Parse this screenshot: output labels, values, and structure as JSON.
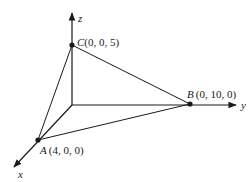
{
  "diagram": {
    "type": "3d-coordinate-triangle",
    "axes": {
      "x": {
        "label": "x"
      },
      "y": {
        "label": "y"
      },
      "z": {
        "label": "z"
      }
    },
    "points": [
      {
        "name": "A",
        "coords": "(4, 0, 0)"
      },
      {
        "name": "B",
        "coords": "(0, 10, 0)"
      },
      {
        "name": "C",
        "coords": "(0, 0, 5)"
      }
    ],
    "edges": [
      "A-B",
      "B-C",
      "C-A"
    ],
    "colors": {
      "line": "#1a1a1a",
      "background": "#ffffff"
    }
  }
}
